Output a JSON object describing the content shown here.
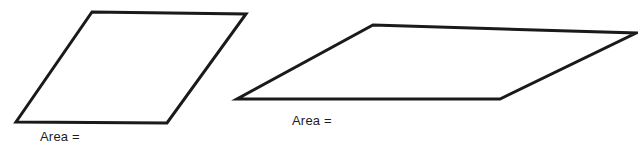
{
  "page": {
    "background_color": "#ffffff"
  },
  "style": {
    "stroke_color": "#1a1a1a",
    "stroke_width": 3,
    "fill_color": "#ffffff",
    "text_color": "#1c1c1c"
  },
  "figures": [
    {
      "name": "parallelogram-1",
      "shape": "parallelogram",
      "points": "92,12 246,14 167,123 16,122",
      "label": "Area ="
    },
    {
      "name": "parallelogram-2",
      "shape": "parallelogram",
      "points": "373,25 636,33 500,99 237,99",
      "label": "Area ="
    }
  ],
  "labels": {
    "area_1": "Area =",
    "area_2": "Area ="
  }
}
